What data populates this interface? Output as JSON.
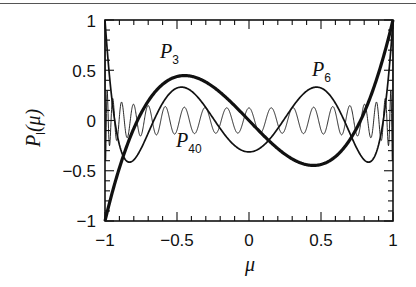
{
  "chart_data": {
    "type": "line",
    "title": "",
    "xlabel": "μ",
    "ylabel": "P_l(μ)",
    "ylabel_main": "P",
    "ylabel_sub": "l",
    "ylabel_arg": "(μ)",
    "xlim": [
      -1,
      1
    ],
    "ylim": [
      -1,
      1
    ],
    "grid": false,
    "legend": "none (inline curve labels)",
    "x_ticks": [
      -1,
      -0.5,
      0,
      0.5,
      1
    ],
    "x_tick_labels": [
      "−1",
      "−0.5",
      "0",
      "0.5",
      "1"
    ],
    "y_ticks": [
      -1,
      -0.5,
      0,
      0.5,
      1
    ],
    "y_tick_labels": [
      "−1",
      "−0.5",
      "0",
      "0.5",
      "1"
    ],
    "minor_tick_step": 0.1,
    "series": [
      {
        "name": "P_3",
        "label_main": "P",
        "label_sub": "3",
        "degree": 3,
        "stroke_width": 3.2,
        "label_pos": [
          -0.52,
          0.6
        ],
        "sample_points": {
          "x": [
            -1,
            -0.7746,
            -0.4472,
            0,
            0.4472,
            0.7746,
            1
          ],
          "y": [
            -1,
            0,
            0.4472,
            0,
            -0.4472,
            0,
            1
          ]
        }
      },
      {
        "name": "P_6",
        "label_main": "P",
        "label_sub": "6",
        "degree": 6,
        "stroke_width": 1.7,
        "label_pos": [
          0.42,
          0.5
        ],
        "sample_points": {
          "x": [
            -1,
            -0.7,
            -0.47,
            0,
            0.47,
            0.7,
            1
          ],
          "y": [
            1,
            -0.33,
            0.33,
            -0.3125,
            0.33,
            -0.33,
            1
          ]
        }
      },
      {
        "name": "P_40",
        "label_main": "P",
        "label_sub": "40",
        "degree": 40,
        "stroke_width": 0.9,
        "label_pos": [
          -0.45,
          -0.2
        ],
        "sample_points": {
          "x": [
            -1,
            0,
            1
          ],
          "y": [
            1,
            0.1254,
            1
          ],
          "note": "rapid oscillation, amplitude ~0.13-0.2 across interior"
        }
      }
    ]
  }
}
